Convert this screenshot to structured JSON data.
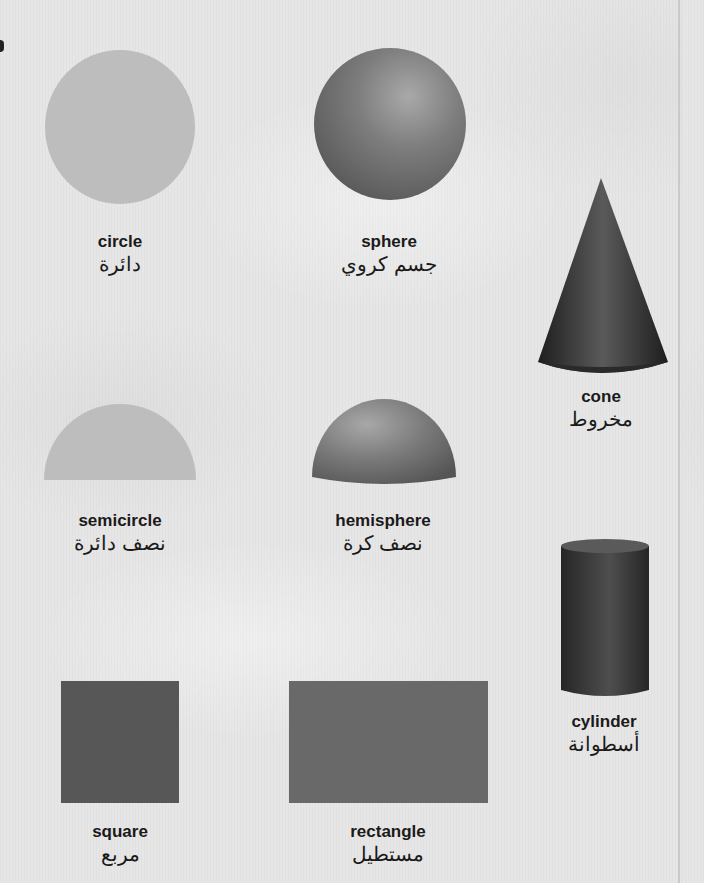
{
  "colors": {
    "background": "#e6e6e6",
    "flat_light": "#bdbdbd",
    "solid_gray": "#7a7a7a",
    "dark_solid": "#3a3a3a",
    "square_fill": "#5a5a5a",
    "rectangle_fill": "#6b6b6b",
    "text": "#1a1a1a"
  },
  "shapes": [
    {
      "id": "circle",
      "en": "circle",
      "ar": "دائرة"
    },
    {
      "id": "sphere",
      "en": "sphere",
      "ar": "جسم كروي"
    },
    {
      "id": "cone",
      "en": "cone",
      "ar": "مخروط"
    },
    {
      "id": "semicircle",
      "en": "semicircle",
      "ar": "نصف دائرة"
    },
    {
      "id": "hemisphere",
      "en": "hemisphere",
      "ar": "نصف كرة"
    },
    {
      "id": "cylinder",
      "en": "cylinder",
      "ar": "أسطوانة"
    },
    {
      "id": "square",
      "en": "square",
      "ar": "مربع"
    },
    {
      "id": "rectangle",
      "en": "rectangle",
      "ar": "مستطيل"
    }
  ]
}
